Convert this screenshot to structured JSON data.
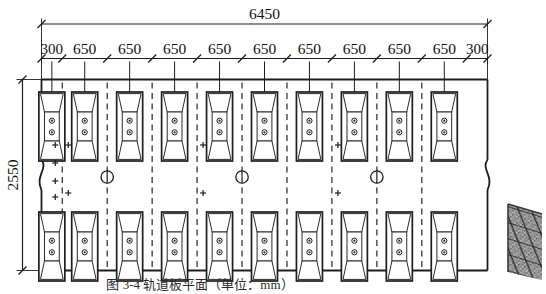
{
  "drawing": {
    "title_caption": "图 3-4  轨道板平面（单位：mm）",
    "overall_top_dimension": "6450",
    "left_dimension": "2550",
    "dimension_chain": [
      "300",
      "650",
      "650",
      "650",
      "650",
      "650",
      "650",
      "650",
      "650",
      "650",
      "300"
    ],
    "units_per_row": 10,
    "rows": 2,
    "detail_markers": [
      "①",
      "①",
      "①"
    ],
    "colors": {
      "line": "#1d1d1d",
      "text": "#111111",
      "background": "#ffffff"
    }
  }
}
